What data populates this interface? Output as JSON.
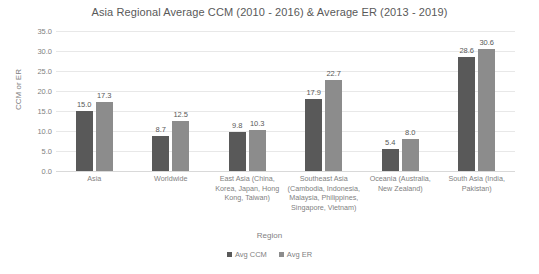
{
  "chart_data": {
    "type": "bar",
    "title": "Asia Regional Average CCM (2010 - 2016) & Average ER (2013 - 2019)",
    "xlabel": "Region",
    "ylabel": "CCM or ER",
    "ylim": [
      0,
      35
    ],
    "ytick_step": 5,
    "grid": true,
    "legend_position": "bottom",
    "yticks": [
      "35.0",
      "30.0",
      "25.0",
      "20.0",
      "15.0",
      "10.0",
      "5.0",
      "0.0"
    ],
    "categories": [
      "Asia",
      "Worldwide",
      "East Asia (China, Korea, Japan, Hong Kong, Taiwan)",
      "Southeast Asia (Cambodia, Indonesia, Malaysia, Philippines, Singapore, Vietnam)",
      "Oceania (Australia, New Zealand)",
      "South Asia (India, Pakistan)"
    ],
    "series": [
      {
        "name": "Avg CCM",
        "color": "#595959",
        "values": [
          15.0,
          8.7,
          9.8,
          17.9,
          5.4,
          28.6
        ],
        "labels": [
          "15.0",
          "8.7",
          "9.8",
          "17.9",
          "5.4",
          "28.6"
        ]
      },
      {
        "name": "Avg ER",
        "color": "#8c8c8c",
        "values": [
          17.3,
          12.5,
          10.3,
          22.7,
          8.0,
          30.6
        ],
        "labels": [
          "17.3",
          "12.5",
          "10.3",
          "22.7",
          "8.0",
          "30.6"
        ]
      }
    ]
  }
}
